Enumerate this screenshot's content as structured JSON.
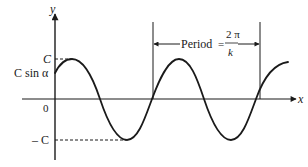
{
  "diagram": {
    "type": "sinusoid",
    "axes": {
      "x_label": "x",
      "y_label": "y",
      "origin_label": "0"
    },
    "y_ticks": {
      "amplitude_pos": "C",
      "phase_intercept": "C sin α",
      "amplitude_neg": "– C"
    },
    "period_annotation": {
      "text": "Period",
      "equals": "=",
      "numerator": "2 π",
      "denominator": "k"
    },
    "colors": {
      "stroke": "#1a1a1a",
      "background": "#ffffff"
    }
  }
}
